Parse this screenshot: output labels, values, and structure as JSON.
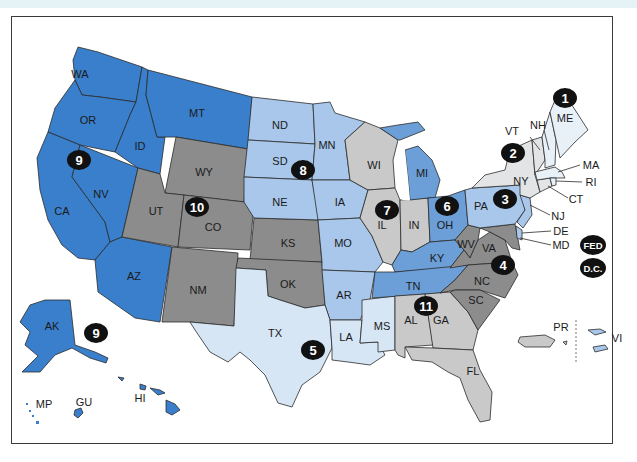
{
  "colors": {
    "blue_dark": "#3a7fcb",
    "blue_mid": "#6c9fd8",
    "blue_light": "#a9c7ea",
    "blue_pale": "#d6e6f5",
    "gray_dark": "#8c8c8c",
    "gray_light": "#c9c9c9",
    "pale_gray": "#e2e4e6",
    "badge": "#111111",
    "border": "#2b2b2b"
  },
  "states": [
    {
      "id": "WA",
      "label": "WA",
      "x": 80,
      "y": 74
    },
    {
      "id": "OR",
      "label": "OR",
      "x": 88,
      "y": 120
    },
    {
      "id": "CA",
      "label": "CA",
      "x": 62,
      "y": 211
    },
    {
      "id": "NV",
      "label": "NV",
      "x": 101,
      "y": 194
    },
    {
      "id": "ID",
      "label": "ID",
      "x": 140,
      "y": 146
    },
    {
      "id": "MT",
      "label": "MT",
      "x": 197,
      "y": 113
    },
    {
      "id": "AZ",
      "label": "AZ",
      "x": 134,
      "y": 276
    },
    {
      "id": "WY",
      "label": "WY",
      "x": 204,
      "y": 172
    },
    {
      "id": "UT",
      "label": "UT",
      "x": 156,
      "y": 211
    },
    {
      "id": "CO",
      "label": "CO",
      "x": 213,
      "y": 227
    },
    {
      "id": "NM",
      "label": "NM",
      "x": 198,
      "y": 290
    },
    {
      "id": "KS",
      "label": "KS",
      "x": 288,
      "y": 243
    },
    {
      "id": "OK",
      "label": "OK",
      "x": 288,
      "y": 284
    },
    {
      "id": "ND",
      "label": "ND",
      "x": 280,
      "y": 125
    },
    {
      "id": "SD",
      "label": "SD",
      "x": 280,
      "y": 161
    },
    {
      "id": "NE",
      "label": "NE",
      "x": 280,
      "y": 202
    },
    {
      "id": "MN",
      "label": "MN",
      "x": 327,
      "y": 145
    },
    {
      "id": "IA",
      "label": "IA",
      "x": 340,
      "y": 202
    },
    {
      "id": "MO",
      "label": "MO",
      "x": 343,
      "y": 243
    },
    {
      "id": "AR",
      "label": "AR",
      "x": 344,
      "y": 295
    },
    {
      "id": "TX",
      "label": "TX",
      "x": 275,
      "y": 333
    },
    {
      "id": "LA",
      "label": "LA",
      "x": 346,
      "y": 337
    },
    {
      "id": "MS",
      "label": "MS",
      "x": 382,
      "y": 326
    },
    {
      "id": "WI",
      "label": "WI",
      "x": 374,
      "y": 165
    },
    {
      "id": "IL",
      "label": "IL",
      "x": 382,
      "y": 225
    },
    {
      "id": "IN",
      "label": "IN",
      "x": 414,
      "y": 225
    },
    {
      "id": "MI",
      "label": "MI",
      "x": 422,
      "y": 173
    },
    {
      "id": "OH",
      "label": "OH",
      "x": 445,
      "y": 225
    },
    {
      "id": "KY",
      "label": "KY",
      "x": 437,
      "y": 258
    },
    {
      "id": "TN",
      "label": "TN",
      "x": 413,
      "y": 286
    },
    {
      "id": "AL",
      "label": "AL",
      "x": 411,
      "y": 320
    },
    {
      "id": "GA",
      "label": "GA",
      "x": 441,
      "y": 320
    },
    {
      "id": "FL",
      "label": "FL",
      "x": 473,
      "y": 371
    },
    {
      "id": "SC",
      "label": "SC",
      "x": 476,
      "y": 300
    },
    {
      "id": "NC",
      "label": "NC",
      "x": 482,
      "y": 281
    },
    {
      "id": "VA",
      "label": "VA",
      "x": 489,
      "y": 248
    },
    {
      "id": "WV",
      "label": "WV",
      "x": 466,
      "y": 244
    },
    {
      "id": "PA",
      "label": "PA",
      "x": 481,
      "y": 206
    },
    {
      "id": "NY",
      "label": "NY",
      "x": 521,
      "y": 181
    },
    {
      "id": "VT",
      "label": "VT",
      "x": 512,
      "y": 131
    },
    {
      "id": "NH",
      "label": "NH",
      "x": 538,
      "y": 125
    },
    {
      "id": "ME",
      "label": "ME",
      "x": 565,
      "y": 118
    },
    {
      "id": "AK",
      "label": "AK",
      "x": 52,
      "y": 326
    },
    {
      "id": "HI",
      "label": "HI",
      "x": 140,
      "y": 398
    },
    {
      "id": "GU",
      "label": "GU",
      "x": 84,
      "y": 402
    },
    {
      "id": "MP",
      "label": "MP",
      "x": 44,
      "y": 404
    },
    {
      "id": "PR",
      "label": "PR",
      "x": 561,
      "y": 327
    },
    {
      "id": "VI",
      "label": "VI",
      "x": 617,
      "y": 338
    }
  ],
  "callouts": [
    {
      "id": "MA",
      "label": "MA",
      "x": 591,
      "y": 165
    },
    {
      "id": "RI",
      "label": "RI",
      "x": 591,
      "y": 182
    },
    {
      "id": "CT",
      "label": "CT",
      "x": 576,
      "y": 199
    },
    {
      "id": "NJ",
      "label": "NJ",
      "x": 558,
      "y": 216
    },
    {
      "id": "DE",
      "label": "DE",
      "x": 561,
      "y": 231
    },
    {
      "id": "MD",
      "label": "MD",
      "x": 561,
      "y": 245
    }
  ],
  "circuits": [
    {
      "label": "1",
      "x": 565,
      "y": 98
    },
    {
      "label": "2",
      "x": 513,
      "y": 153
    },
    {
      "label": "3",
      "x": 505,
      "y": 199
    },
    {
      "label": "4",
      "x": 503,
      "y": 265
    },
    {
      "label": "5",
      "x": 313,
      "y": 350
    },
    {
      "label": "6",
      "x": 447,
      "y": 206
    },
    {
      "label": "7",
      "x": 387,
      "y": 210
    },
    {
      "label": "8",
      "x": 303,
      "y": 170
    },
    {
      "label": "9",
      "x": 79,
      "y": 160
    },
    {
      "label": "9",
      "x": 96,
      "y": 333
    },
    {
      "label": "10",
      "x": 197,
      "y": 207
    },
    {
      "label": "11",
      "x": 426,
      "y": 306
    },
    {
      "label": "FED",
      "x": 593,
      "y": 245
    },
    {
      "label": "D.C.",
      "x": 593,
      "y": 268
    }
  ]
}
